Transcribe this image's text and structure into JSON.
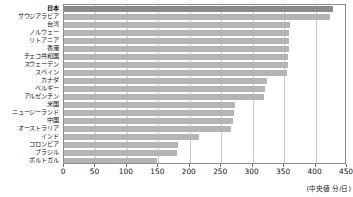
{
  "chart_data": {
    "type": "bar",
    "orientation": "horizontal",
    "title": "",
    "xlabel": "",
    "ylabel": "",
    "unit_caption": "(中央値 分/日)",
    "xlim": [
      0,
      450
    ],
    "grid": true,
    "legend": false,
    "xticks": [
      0,
      50,
      100,
      150,
      200,
      250,
      300,
      350,
      400,
      450
    ],
    "xtick_labels": [
      "0",
      "50",
      "100",
      "150",
      "200",
      "250",
      "300",
      "350",
      "400",
      "450"
    ],
    "categories": [
      "日本",
      "サウジアラビア",
      "台湾",
      "ノルウェー",
      "リトアニア",
      "香港",
      "チェコ共和国",
      "スウェーデン",
      "スペイン",
      "カナダ",
      "ベルギー",
      "アルゼンチン",
      "米国",
      "ニュージーランド",
      "中国",
      "オーストラリア",
      "インド",
      "コロンビア",
      "ブラジル",
      "ポルトガル"
    ],
    "values": [
      428,
      423,
      360,
      358,
      357,
      357,
      356,
      356,
      355,
      322,
      320,
      318,
      272,
      270,
      268,
      266,
      215,
      182,
      180,
      148
    ],
    "highlight_index": 0,
    "colors": {
      "bar": "#b4b4b4",
      "bar_highlight": "#8a8a8a",
      "grid": "#c9c9c9",
      "frame": "#8c8c8c",
      "text": "#111111",
      "background": "#ffffff"
    }
  }
}
